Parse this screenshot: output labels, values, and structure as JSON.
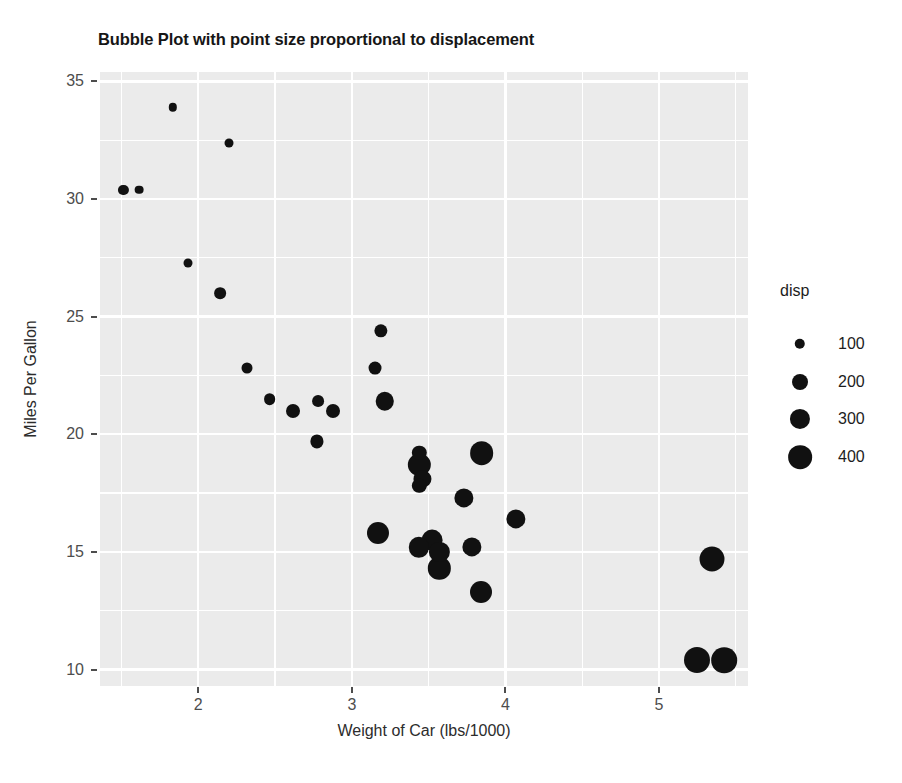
{
  "chart_data": {
    "type": "scatter",
    "title": "Bubble Plot with point size proportional to displacement",
    "xlabel": "Weight of Car (lbs/1000)",
    "ylabel": "Miles Per Gallon",
    "xlim": [
      1.36,
      5.58
    ],
    "ylim": [
      9.3,
      35.4
    ],
    "xticks": [
      "2",
      "3",
      "4",
      "5"
    ],
    "xtick_values": [
      2,
      3,
      4,
      5
    ],
    "xminor_values": [
      1.5,
      2.5,
      3.5,
      4.5,
      5.5
    ],
    "yticks": [
      "35",
      "30",
      "25",
      "20",
      "15",
      "10"
    ],
    "ytick_values": [
      35,
      30,
      25,
      20,
      15,
      10
    ],
    "yminor_values": [
      12.5,
      17.5,
      22.5,
      27.5,
      32.5
    ],
    "grid": true,
    "panel_background": "#ebebeb",
    "gridline_color": "#ffffff",
    "point_color": "#111111",
    "size_variable": "disp",
    "size_range": [
      60,
      472
    ],
    "legend": {
      "position": "right",
      "title": "disp",
      "entries": [
        {
          "label": "100",
          "value": 100
        },
        {
          "label": "200",
          "value": 200
        },
        {
          "label": "300",
          "value": 300
        },
        {
          "label": "400",
          "value": 400
        }
      ]
    },
    "series": [
      {
        "name": "mtcars",
        "x_name": "wt",
        "y_name": "mpg",
        "size_name": "disp",
        "points": [
          {
            "x": 2.62,
            "y": 21.0,
            "size": 160.0
          },
          {
            "x": 2.875,
            "y": 21.0,
            "size": 160.0
          },
          {
            "x": 2.32,
            "y": 22.8,
            "size": 108.0
          },
          {
            "x": 3.215,
            "y": 21.4,
            "size": 258.0
          },
          {
            "x": 3.44,
            "y": 18.7,
            "size": 360.0
          },
          {
            "x": 3.46,
            "y": 18.1,
            "size": 225.0
          },
          {
            "x": 3.57,
            "y": 14.3,
            "size": 360.0
          },
          {
            "x": 3.19,
            "y": 24.4,
            "size": 146.7
          },
          {
            "x": 3.15,
            "y": 22.8,
            "size": 140.8
          },
          {
            "x": 3.44,
            "y": 19.2,
            "size": 167.6
          },
          {
            "x": 3.44,
            "y": 17.8,
            "size": 167.6
          },
          {
            "x": 4.07,
            "y": 16.4,
            "size": 275.8
          },
          {
            "x": 3.73,
            "y": 17.3,
            "size": 275.8
          },
          {
            "x": 3.78,
            "y": 15.2,
            "size": 275.8
          },
          {
            "x": 5.25,
            "y": 10.4,
            "size": 472.0
          },
          {
            "x": 5.424,
            "y": 10.4,
            "size": 460.0
          },
          {
            "x": 5.345,
            "y": 14.7,
            "size": 440.0
          },
          {
            "x": 2.2,
            "y": 32.4,
            "size": 78.7
          },
          {
            "x": 1.615,
            "y": 30.4,
            "size": 75.7
          },
          {
            "x": 1.835,
            "y": 33.9,
            "size": 71.1
          },
          {
            "x": 2.465,
            "y": 21.5,
            "size": 120.1
          },
          {
            "x": 3.52,
            "y": 15.5,
            "size": 318.0
          },
          {
            "x": 3.435,
            "y": 15.2,
            "size": 304.0
          },
          {
            "x": 3.84,
            "y": 13.3,
            "size": 350.0
          },
          {
            "x": 3.845,
            "y": 19.2,
            "size": 400.0
          },
          {
            "x": 1.935,
            "y": 27.3,
            "size": 79.0
          },
          {
            "x": 2.14,
            "y": 26.0,
            "size": 120.3
          },
          {
            "x": 1.513,
            "y": 30.4,
            "size": 95.1
          },
          {
            "x": 3.17,
            "y": 15.8,
            "size": 351.0
          },
          {
            "x": 2.77,
            "y": 19.7,
            "size": 145.0
          },
          {
            "x": 3.57,
            "y": 15.0,
            "size": 301.0
          },
          {
            "x": 2.78,
            "y": 21.4,
            "size": 121.0
          }
        ]
      }
    ]
  }
}
